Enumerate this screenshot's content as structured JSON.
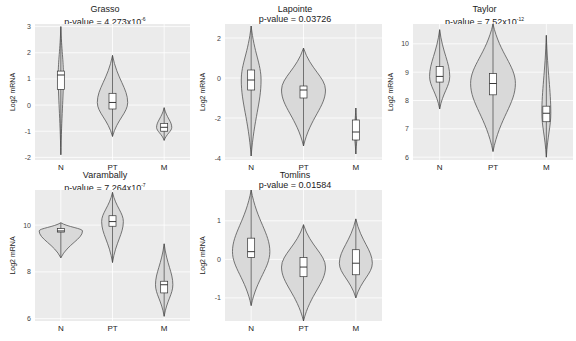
{
  "figure": {
    "background": "#ffffff",
    "plot_bg": "#ebebeb",
    "violin_fill": "#d9d9d9",
    "violin_stroke": "#555555"
  },
  "chart_data": [
    {
      "type": "violin",
      "title": "Grasso",
      "subtitle": "p-value = 4.273x10",
      "exponent": "-6",
      "xlabel": "",
      "ylabel": "Log2 mRNA",
      "categories": [
        "N",
        "PT",
        "M"
      ],
      "yticks": [
        -2,
        -1,
        0,
        1,
        2,
        3
      ],
      "ylim": [
        -2.1,
        3.1
      ],
      "series": [
        {
          "name": "N",
          "min": -1.9,
          "q1": 0.6,
          "median": 1.15,
          "q3": 1.3,
          "max": 3.0,
          "width": 0.12
        },
        {
          "name": "PT",
          "min": -1.2,
          "q1": -0.15,
          "median": 0.1,
          "q3": 0.45,
          "max": 1.9,
          "width": 0.7
        },
        {
          "name": "M",
          "min": -1.35,
          "q1": -1.0,
          "median": -0.85,
          "q3": -0.7,
          "max": -0.1,
          "width": 0.35
        }
      ]
    },
    {
      "type": "violin",
      "title": "Lapointe",
      "subtitle": "p-value = 0.03726",
      "exponent": "",
      "xlabel": "",
      "ylabel": "Log2 mRNA",
      "categories": [
        "N",
        "PT",
        "M"
      ],
      "yticks": [
        -4,
        -2,
        0,
        2
      ],
      "ylim": [
        -4.1,
        2.7
      ],
      "series": [
        {
          "name": "N",
          "min": -3.9,
          "q1": -0.6,
          "median": -0.1,
          "q3": 0.4,
          "max": 2.6,
          "width": 0.45
        },
        {
          "name": "PT",
          "min": -3.4,
          "q1": -1.0,
          "median": -0.6,
          "q3": -0.4,
          "max": 1.5,
          "width": 1.0
        },
        {
          "name": "M",
          "min": -3.8,
          "q1": -3.1,
          "median": -2.7,
          "q3": -2.1,
          "max": -1.5,
          "width": 0.0
        }
      ]
    },
    {
      "type": "violin",
      "title": "Taylor",
      "subtitle": "p-value = 7.52x10",
      "exponent": "-12",
      "xlabel": "",
      "ylabel": "Log2 mRNA",
      "categories": [
        "N",
        "PT",
        "M"
      ],
      "yticks": [
        6,
        7,
        8,
        9,
        10
      ],
      "ylim": [
        5.9,
        10.7
      ],
      "series": [
        {
          "name": "N",
          "min": 7.7,
          "q1": 8.65,
          "median": 8.85,
          "q3": 9.2,
          "max": 10.5,
          "width": 0.45
        },
        {
          "name": "PT",
          "min": 6.2,
          "q1": 8.2,
          "median": 8.6,
          "q3": 8.95,
          "max": 10.7,
          "width": 1.0
        },
        {
          "name": "M",
          "min": 6.0,
          "q1": 7.25,
          "median": 7.55,
          "q3": 7.8,
          "max": 10.3,
          "width": 0.2
        }
      ]
    },
    {
      "type": "violin",
      "title": "Varambally",
      "subtitle": "p-value = 7.264x10",
      "exponent": "-7",
      "xlabel": "",
      "ylabel": "Log2 mRNA",
      "categories": [
        "N",
        "PT",
        "M"
      ],
      "yticks": [
        6,
        8,
        10
      ],
      "ylim": [
        5.9,
        11.5
      ],
      "series": [
        {
          "name": "N",
          "min": 8.6,
          "q1": 9.7,
          "median": 9.75,
          "q3": 9.85,
          "max": 10.1,
          "width": 1.0
        },
        {
          "name": "PT",
          "min": 8.4,
          "q1": 9.95,
          "median": 10.15,
          "q3": 10.4,
          "max": 11.4,
          "width": 0.5
        },
        {
          "name": "M",
          "min": 6.1,
          "q1": 7.1,
          "median": 7.45,
          "q3": 7.6,
          "max": 9.2,
          "width": 0.4
        }
      ]
    },
    {
      "type": "violin",
      "title": "Tomlins",
      "subtitle": "p-value = 0.01584",
      "exponent": "",
      "xlabel": "",
      "ylabel": "Log2 mRNA",
      "categories": [
        "N",
        "PT",
        "M"
      ],
      "yticks": [
        -1,
        0,
        1
      ],
      "ylim": [
        -1.6,
        1.8
      ],
      "series": [
        {
          "name": "N",
          "min": -1.2,
          "q1": 0.05,
          "median": 0.2,
          "q3": 0.55,
          "max": 1.8,
          "width": 0.85
        },
        {
          "name": "PT",
          "min": -1.6,
          "q1": -0.45,
          "median": -0.2,
          "q3": 0.05,
          "max": 0.9,
          "width": 1.0
        },
        {
          "name": "M",
          "min": -1.0,
          "q1": -0.4,
          "median": -0.1,
          "q3": 0.25,
          "max": 1.05,
          "width": 0.75
        }
      ]
    }
  ]
}
